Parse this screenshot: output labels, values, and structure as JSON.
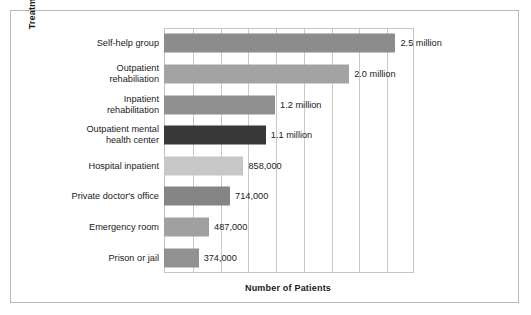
{
  "chart_data": {
    "type": "bar",
    "orientation": "horizontal",
    "title": "",
    "xlabel": "Number of Patients",
    "ylabel": "Treatment Location",
    "xlim": [
      0,
      2700000
    ],
    "grid": true,
    "gridlines": 9,
    "legend": "none",
    "categories": [
      "Self-help group",
      "Outpatient\nrehabiliation",
      "Inpatient\nrehabilitation",
      "Outpatient mental\nhealth center",
      "Hospital inpatient",
      "Private doctor's office",
      "Emergency room",
      "Prison or jail"
    ],
    "values": [
      2500000,
      2000000,
      1200000,
      1100000,
      858000,
      714000,
      487000,
      374000
    ],
    "value_labels": [
      "2.5 million",
      "2.0 million",
      "1.2 million",
      "1.1 million",
      "858,000",
      "714,000",
      "487,000",
      "374,000"
    ],
    "bar_colors": [
      "#8c8c8c",
      "#a3a3a3",
      "#8f8f8f",
      "#383838",
      "#c7c7c7",
      "#858585",
      "#a0a0a0",
      "#919191"
    ]
  },
  "figure": {
    "border_color": "#b9b9b9",
    "plot_border_color": "#c4c4c4",
    "grid_color": "#c9c9c9",
    "background": "#ffffff",
    "text_color": "#1a1a1a"
  }
}
